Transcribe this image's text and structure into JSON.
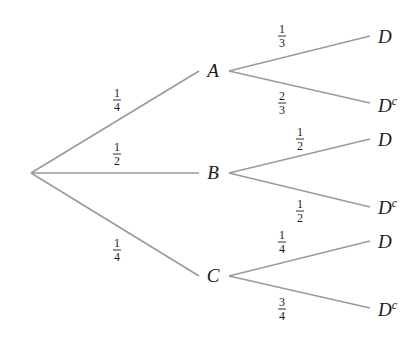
{
  "diagram": {
    "type": "probability-tree",
    "colors": {
      "edge": "#9a9a9a",
      "text": "#1a1a1a",
      "background": "#ffffff"
    },
    "root": {
      "x": 31,
      "y": 173
    },
    "first_level": [
      {
        "id": "A",
        "label": "A",
        "x": 213,
        "y": 71,
        "edge_prob": {
          "num": "1",
          "den": "4"
        },
        "edge_label_pos": {
          "x": 117,
          "y": 100
        },
        "children": [
          {
            "label": "D",
            "sup": "",
            "prob": {
              "num": "1",
              "den": "3"
            },
            "end": {
              "x": 370,
              "y": 36
            },
            "label_pos": {
              "x": 378,
              "y": 43
            },
            "prob_pos": {
              "x": 282,
              "y": 36
            }
          },
          {
            "label": "D",
            "sup": "c",
            "prob": {
              "num": "2",
              "den": "3"
            },
            "end": {
              "x": 370,
              "y": 103
            },
            "label_pos": {
              "x": 378,
              "y": 112
            },
            "prob_pos": {
              "x": 282,
              "y": 103
            }
          }
        ]
      },
      {
        "id": "B",
        "label": "B",
        "x": 213,
        "y": 173,
        "edge_prob": {
          "num": "1",
          "den": "2"
        },
        "edge_label_pos": {
          "x": 117,
          "y": 154
        },
        "children": [
          {
            "label": "D",
            "sup": "",
            "prob": {
              "num": "1",
              "den": "2"
            },
            "end": {
              "x": 370,
              "y": 139
            },
            "label_pos": {
              "x": 378,
              "y": 146
            },
            "prob_pos": {
              "x": 300,
              "y": 139
            }
          },
          {
            "label": "D",
            "sup": "c",
            "prob": {
              "num": "1",
              "den": "2"
            },
            "end": {
              "x": 370,
              "y": 207
            },
            "label_pos": {
              "x": 378,
              "y": 214
            },
            "prob_pos": {
              "x": 300,
              "y": 211
            }
          }
        ]
      },
      {
        "id": "C",
        "label": "C",
        "x": 213,
        "y": 276,
        "edge_prob": {
          "num": "1",
          "den": "4"
        },
        "edge_label_pos": {
          "x": 117,
          "y": 250
        },
        "children": [
          {
            "label": "D",
            "sup": "",
            "prob": {
              "num": "1",
              "den": "4"
            },
            "end": {
              "x": 370,
              "y": 241
            },
            "label_pos": {
              "x": 378,
              "y": 248
            },
            "prob_pos": {
              "x": 282,
              "y": 242
            }
          },
          {
            "label": "D",
            "sup": "c",
            "prob": {
              "num": "3",
              "den": "4"
            },
            "end": {
              "x": 370,
              "y": 308
            },
            "label_pos": {
              "x": 378,
              "y": 316
            },
            "prob_pos": {
              "x": 282,
              "y": 309
            }
          }
        ]
      }
    ]
  }
}
